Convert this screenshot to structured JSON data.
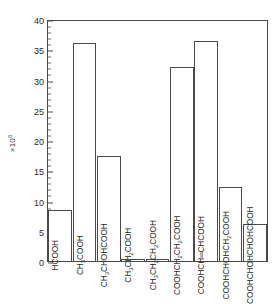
{
  "chart_data": {
    "type": "bar",
    "title": "",
    "xlabel": "",
    "ylabel": "",
    "y_multiplier": "×10",
    "y_multiplier_exponent": "6",
    "ylim": [
      0,
      40
    ],
    "yticks": [
      0,
      5,
      10,
      15,
      20,
      25,
      30,
      35,
      40
    ],
    "ytick_labels": [
      "0",
      "5",
      "10",
      "15",
      "20",
      "25",
      "30",
      "35",
      "40"
    ],
    "minor_tick_step": 1,
    "grid": false,
    "legend": false,
    "categories": [
      "HCOOH",
      "CH3COOH",
      "CH3CHOHCOOH",
      "CH3CH2COOH",
      "CH3CH2CH2COOH",
      "COOHCH2CH2COOH",
      "COOHCH=CHCOOH",
      "COOHCHOHCH2COOH",
      "COOHCHOHCHOHCOOH"
    ],
    "values": [
      8.5,
      36.0,
      17.3,
      0.3,
      0.3,
      32.0,
      36.3,
      12.3,
      6.2
    ]
  },
  "bars": [
    {
      "label_html": "HCOOH",
      "value": 8.5
    },
    {
      "label_html": "CH<sub>3</sub>COOH",
      "value": 36.0
    },
    {
      "label_html": "CH<sub>3</sub>CHOHCOOH",
      "value": 17.3
    },
    {
      "label_html": "CH<sub>3</sub>CH<sub>2</sub>COOH",
      "value": 0.3
    },
    {
      "label_html": "CH<sub>3</sub>CH<sub>2</sub>CH<sub>2</sub>COOH",
      "value": 0.3
    },
    {
      "label_html": "COOHCH<sub>2</sub>CH<sub>2</sub>COOH",
      "value": 32.0
    },
    {
      "label_html": "COOHCH<span class=\"dbond\">═</span>CHCOOH",
      "value": 36.3
    },
    {
      "label_html": "COOHCHOHCH<sub>2</sub>COOH",
      "value": 12.3
    },
    {
      "label_html": "COOHCHOHCHOHCOOH",
      "value": 6.2
    }
  ],
  "colors": {
    "axis": "#4a4a4a",
    "bar_outline": "#4a4a4a",
    "bar_fill": "#ffffff",
    "text": "#2b2b2b",
    "background": "#ffffff"
  }
}
